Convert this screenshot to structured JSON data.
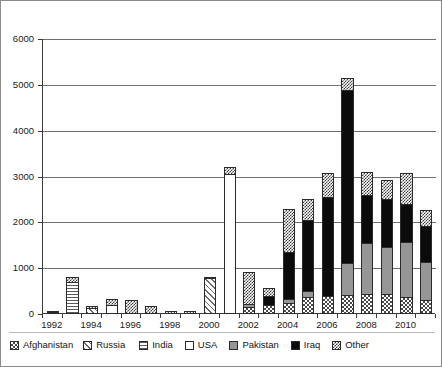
{
  "chart_data": {
    "type": "bar",
    "subtype": "stacked-bar",
    "title": "",
    "xlabel": "",
    "ylabel": "",
    "ylim": [
      0,
      6000
    ],
    "ytick_step": 1000,
    "yticks": [
      "0",
      "1000",
      "2000",
      "3000",
      "4000",
      "5000",
      "6000"
    ],
    "grid": true,
    "legend_position": "bottom",
    "categories": [
      "1992",
      "1993",
      "1994",
      "1995",
      "1996",
      "1997",
      "1998",
      "1999",
      "2000",
      "2001",
      "2002",
      "2003",
      "2004",
      "2005",
      "2006",
      "2007",
      "2008",
      "2009",
      "2010",
      "2011"
    ],
    "xtick_labels": [
      "1992",
      "1994",
      "1996",
      "1998",
      "2000",
      "2002",
      "2004",
      "2006",
      "2008",
      "2010"
    ],
    "series": [
      {
        "name": "Afghanistan",
        "key": "afghanistan",
        "pattern": "checkerboard-dark",
        "color": "#4a4a4a",
        "values": [
          20,
          0,
          0,
          0,
          0,
          0,
          0,
          0,
          0,
          0,
          150,
          200,
          230,
          380,
          400,
          420,
          430,
          430,
          380,
          300
        ]
      },
      {
        "name": "Russia",
        "key": "russia",
        "pattern": "diagonal-hatch",
        "color": "#6b6b6b",
        "values": [
          0,
          0,
          130,
          0,
          0,
          0,
          0,
          0,
          780,
          0,
          0,
          0,
          0,
          0,
          0,
          0,
          0,
          0,
          0,
          0
        ]
      },
      {
        "name": "India",
        "key": "india",
        "pattern": "horizontal-lines",
        "color": "#5a5a5a",
        "values": [
          0,
          700,
          0,
          0,
          0,
          0,
          0,
          0,
          0,
          0,
          0,
          0,
          0,
          0,
          0,
          0,
          0,
          0,
          0,
          0
        ]
      },
      {
        "name": "USA",
        "key": "usa",
        "pattern": "solid-white",
        "color": "#ffffff",
        "values": [
          0,
          0,
          0,
          200,
          0,
          0,
          0,
          0,
          0,
          3050,
          0,
          0,
          0,
          0,
          0,
          0,
          0,
          0,
          0,
          0
        ]
      },
      {
        "name": "Pakistan",
        "key": "pakistan",
        "pattern": "solid-gray",
        "color": "#969696",
        "values": [
          0,
          0,
          0,
          0,
          0,
          0,
          0,
          0,
          0,
          0,
          80,
          0,
          120,
          150,
          0,
          720,
          1150,
          1050,
          1220,
          860
        ]
      },
      {
        "name": "Iraq",
        "key": "iraq",
        "pattern": "solid-black",
        "color": "#0b0b0b",
        "values": [
          0,
          0,
          0,
          0,
          0,
          0,
          0,
          0,
          0,
          0,
          0,
          220,
          1050,
          1560,
          2180,
          3800,
          1050,
          1080,
          840,
          800
        ]
      },
      {
        "name": "Other",
        "key": "other",
        "pattern": "checkerboard-fine",
        "color": "#3d3d3d",
        "values": [
          20,
          130,
          60,
          150,
          300,
          180,
          60,
          60,
          60,
          180,
          730,
          200,
          960,
          480,
          550,
          280,
          540,
          430,
          700,
          380
        ]
      }
    ],
    "totals": [
      40,
      830,
      190,
      350,
      300,
      180,
      840,
      380,
      840,
      3230,
      1040,
      620,
      2360,
      2570,
      3130,
      5220,
      3170,
      2990,
      3140,
      2340
    ]
  },
  "legend": {
    "items": [
      {
        "label": "Afghanistan",
        "key": "afghanistan"
      },
      {
        "label": "Russia",
        "key": "russia"
      },
      {
        "label": "India",
        "key": "india"
      },
      {
        "label": "USA",
        "key": "usa"
      },
      {
        "label": "Pakistan",
        "key": "pakistan"
      },
      {
        "label": "Iraq",
        "key": "iraq"
      },
      {
        "label": "Other",
        "key": "other"
      }
    ]
  }
}
